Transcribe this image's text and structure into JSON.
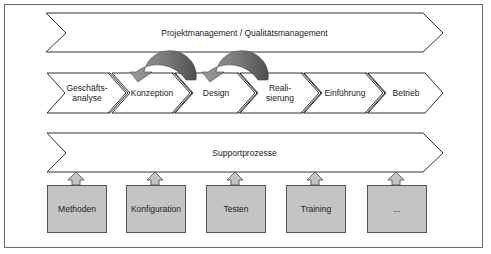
{
  "management_bar": {
    "label": "Projektmanagement / Qualitätsmanagement"
  },
  "phases": [
    {
      "label": "Geschäfts-\nanalyse"
    },
    {
      "label": "Konzeption"
    },
    {
      "label": "Design"
    },
    {
      "label": "Reali-\nsierung"
    },
    {
      "label": "Einführung"
    },
    {
      "label": "Betrieb"
    }
  ],
  "feedback_arrows": [
    {
      "from": "Design",
      "to": "Konzeption"
    },
    {
      "from": "Realisierung",
      "to": "Design"
    }
  ],
  "support_bar": {
    "label": "Supportprozesse"
  },
  "support_boxes": [
    {
      "label": "Methoden"
    },
    {
      "label": "Konfiguration"
    },
    {
      "label": "Testen"
    },
    {
      "label": "Training"
    },
    {
      "label": "..."
    }
  ],
  "colors": {
    "box_fill": "#c4c4c4",
    "arrow_light": "#8c8c8c",
    "arrow_dark": "#5a5a5a",
    "stroke": "#333333"
  }
}
